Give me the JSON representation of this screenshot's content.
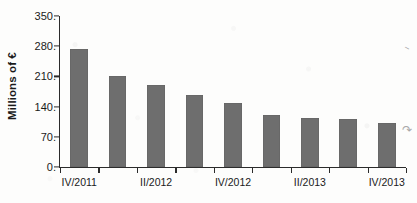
{
  "chart_data": {
    "type": "bar",
    "title": "",
    "xlabel": "",
    "ylabel": "Millions of €",
    "ylim": [
      0,
      350
    ],
    "yticks": [
      0,
      70,
      140,
      210,
      280,
      350
    ],
    "ytick_labels": [
      "0.",
      "70.",
      "140.",
      "210.",
      "280.",
      "350."
    ],
    "grid": false,
    "legend": null,
    "categories": [
      "IV/2011",
      "I/2012",
      "II/2012",
      "III/2012",
      "IV/2012",
      "I/2013",
      "II/2013",
      "III/2013",
      "IV/2013"
    ],
    "visible_xtick_labels": [
      "IV/2011",
      "II/2012",
      "IV/2012",
      "II/2013",
      "IV/2013"
    ],
    "values": [
      274,
      210,
      191,
      168,
      149,
      121,
      114,
      112,
      103
    ],
    "bar_color": "#6e6e6e",
    "axis_color": "#2b2b2b"
  },
  "scan_marks": [
    "⸺",
    "⤳"
  ]
}
